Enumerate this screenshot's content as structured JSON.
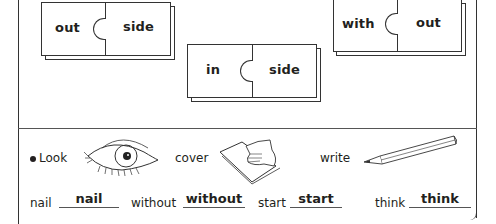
{
  "worksheet": {
    "puzzles": [
      {
        "left": "out",
        "right": "side"
      },
      {
        "left": "in",
        "right": "side"
      },
      {
        "left": "with",
        "right": "out"
      }
    ],
    "instructions": {
      "bullet": "●",
      "steps": [
        {
          "label": "Look",
          "icon": "eye-icon"
        },
        {
          "label": "cover",
          "icon": "hand-covering-paper-icon"
        },
        {
          "label": "write",
          "icon": "pencil-icon"
        }
      ]
    },
    "spelling": [
      {
        "prompt": "nail",
        "answer": "nail"
      },
      {
        "prompt": "without",
        "answer": "without"
      },
      {
        "prompt": "start",
        "answer": "start"
      },
      {
        "prompt": "think",
        "answer": "think"
      }
    ]
  }
}
